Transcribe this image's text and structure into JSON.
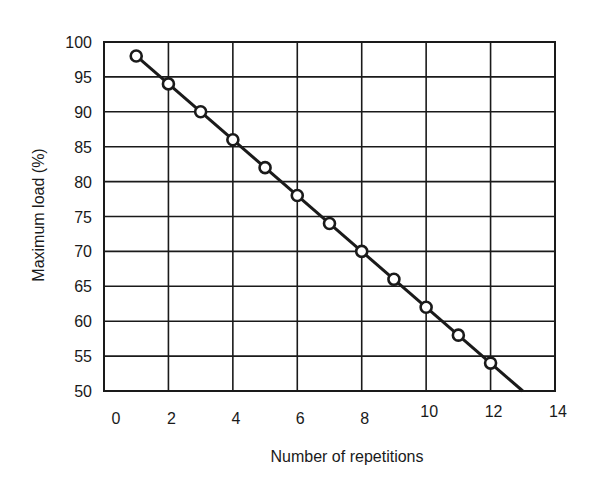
{
  "chart_data": {
    "type": "line",
    "title": "",
    "xlabel": "Number of repetitions",
    "ylabel": "Maximum load (%)",
    "xlim": [
      0,
      14
    ],
    "ylim": [
      50,
      100
    ],
    "x_ticks": [
      0,
      2,
      4,
      6,
      8,
      10,
      12,
      14
    ],
    "y_ticks": [
      50,
      55,
      60,
      65,
      70,
      75,
      80,
      85,
      90,
      95,
      100
    ],
    "grid": true,
    "legend": null,
    "series": [
      {
        "name": "Maximum load vs repetitions",
        "marker": "open-circle",
        "x": [
          1,
          2,
          3,
          4,
          5,
          6,
          7,
          8,
          9,
          10,
          11,
          12
        ],
        "values": [
          98,
          94,
          90,
          86,
          82,
          78,
          74,
          70,
          66,
          62,
          58,
          54
        ]
      }
    ],
    "trend_line": {
      "from": [
        1,
        98
      ],
      "to": [
        13,
        50
      ]
    }
  },
  "colors": {
    "ink": "#1a1a1a",
    "background": "#ffffff"
  }
}
